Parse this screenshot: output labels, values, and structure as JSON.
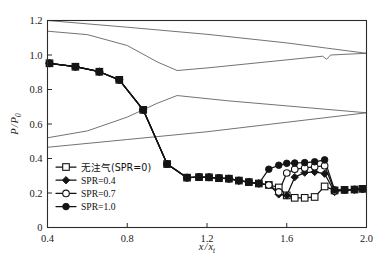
{
  "chart_data": {
    "type": "line",
    "title": "",
    "xlabel": "x/x_t",
    "ylabel": "P/P_0",
    "xlim": [
      0.4,
      2.0
    ],
    "ylim": [
      0.0,
      1.2
    ],
    "xticks": [
      "0.4",
      "0.8",
      "1.2",
      "1.6",
      "2.0"
    ],
    "xtick_values": [
      0.4,
      0.8,
      1.2,
      1.6,
      2.0
    ],
    "yticks": [
      "0",
      "0.2",
      "0.4",
      "0.6",
      "0.8",
      "1.0",
      "1.2"
    ],
    "ytick_values": [
      0,
      0.2,
      0.4,
      0.6,
      0.8,
      1.0,
      1.2
    ],
    "grid": false,
    "legend_position": "lower-left",
    "series": [
      {
        "name": "无注气(SPR=0)",
        "marker": "open-square",
        "line": "solid",
        "x": [
          0.41,
          0.54,
          0.66,
          0.76,
          0.88,
          1.0,
          1.1,
          1.16,
          1.21,
          1.26,
          1.31,
          1.36,
          1.41,
          1.46,
          1.51,
          1.56,
          1.6,
          1.64,
          1.69,
          1.74,
          1.79,
          1.84,
          1.89,
          1.94,
          1.98
        ],
        "y": [
          0.952,
          0.932,
          0.903,
          0.856,
          0.682,
          0.368,
          0.289,
          0.292,
          0.291,
          0.286,
          0.283,
          0.272,
          0.263,
          0.255,
          0.247,
          0.232,
          0.186,
          0.172,
          0.172,
          0.177,
          0.238,
          0.215,
          0.218,
          0.22,
          0.224
        ]
      },
      {
        "name": "SPR=0.4",
        "marker": "filled-diamond",
        "line": "solid",
        "x": [
          0.41,
          0.54,
          0.66,
          0.76,
          0.88,
          1.0,
          1.1,
          1.16,
          1.21,
          1.26,
          1.31,
          1.36,
          1.41,
          1.46,
          1.51,
          1.56,
          1.6,
          1.64,
          1.69,
          1.74,
          1.79,
          1.84,
          1.89,
          1.94,
          1.98
        ],
        "y": [
          0.952,
          0.932,
          0.903,
          0.856,
          0.682,
          0.368,
          0.289,
          0.292,
          0.291,
          0.286,
          0.283,
          0.272,
          0.263,
          0.255,
          0.247,
          0.192,
          0.186,
          0.292,
          0.318,
          0.322,
          0.312,
          0.206,
          0.218,
          0.22,
          0.224
        ]
      },
      {
        "name": "SPR=0.7",
        "marker": "open-circle",
        "line": "solid",
        "x": [
          0.41,
          0.54,
          0.66,
          0.76,
          0.88,
          1.0,
          1.1,
          1.16,
          1.21,
          1.26,
          1.31,
          1.36,
          1.41,
          1.46,
          1.51,
          1.56,
          1.6,
          1.64,
          1.69,
          1.74,
          1.79,
          1.84,
          1.89,
          1.94,
          1.98
        ],
        "y": [
          0.952,
          0.932,
          0.903,
          0.856,
          0.682,
          0.368,
          0.289,
          0.292,
          0.291,
          0.286,
          0.283,
          0.272,
          0.263,
          0.255,
          0.247,
          0.206,
          0.316,
          0.337,
          0.345,
          0.352,
          0.358,
          0.212,
          0.218,
          0.22,
          0.224
        ]
      },
      {
        "name": "SPR=1.0",
        "marker": "filled-circle",
        "line": "solid",
        "x": [
          0.41,
          0.54,
          0.66,
          0.76,
          0.88,
          1.0,
          1.1,
          1.16,
          1.21,
          1.26,
          1.31,
          1.36,
          1.41,
          1.46,
          1.51,
          1.56,
          1.6,
          1.64,
          1.69,
          1.74,
          1.79,
          1.84,
          1.89,
          1.94,
          1.98
        ],
        "y": [
          0.952,
          0.932,
          0.903,
          0.856,
          0.682,
          0.368,
          0.289,
          0.292,
          0.291,
          0.286,
          0.283,
          0.272,
          0.263,
          0.255,
          0.338,
          0.361,
          0.372,
          0.374,
          0.376,
          0.381,
          0.392,
          0.218,
          0.218,
          0.22,
          0.224
        ]
      }
    ],
    "background_curves": [
      {
        "name": "upper-wall-line-1",
        "x": [
          0.4,
          0.8,
          1.2,
          1.6,
          1.8,
          2.0
        ],
        "y": [
          1.2,
          1.161,
          1.12,
          1.07,
          1.04,
          1.01
        ]
      },
      {
        "name": "upper-wall-line-2",
        "x": [
          0.4,
          0.6,
          0.8,
          0.95,
          1.05,
          1.2,
          1.5,
          1.78,
          1.8,
          1.82,
          2.0
        ],
        "y": [
          1.138,
          1.118,
          1.055,
          0.96,
          0.91,
          0.925,
          0.96,
          0.993,
          0.975,
          1.0,
          1.01
        ]
      },
      {
        "name": "lower-wall-line-1",
        "x": [
          0.4,
          0.6,
          0.8,
          0.95,
          1.05,
          1.3,
          1.6,
          2.0
        ],
        "y": [
          0.52,
          0.56,
          0.64,
          0.72,
          0.765,
          0.735,
          0.705,
          0.665
        ]
      },
      {
        "name": "lower-wall-line-2",
        "x": [
          0.4,
          0.8,
          1.2,
          1.6,
          2.0
        ],
        "y": [
          0.465,
          0.51,
          0.555,
          0.61,
          0.665
        ]
      }
    ]
  },
  "legend": {
    "entries": [
      {
        "label": "无注气(SPR=0)",
        "marker": "open-square"
      },
      {
        "label": "SPR=0.4",
        "marker": "filled-diamond"
      },
      {
        "label": "SPR=0.7",
        "marker": "open-circle"
      },
      {
        "label": "SPR=1.0",
        "marker": "filled-circle"
      }
    ]
  },
  "axes": {
    "x_title_num": "x",
    "x_title_den": "x",
    "x_title_den_sub": "t",
    "y_title_num": "P",
    "y_title_den": "P",
    "y_title_den_sub": "0"
  },
  "colors": {
    "frame": "#2b2b2b",
    "data": "#141414",
    "background_curve": "#5a5a5a",
    "page": "#ffffff"
  }
}
